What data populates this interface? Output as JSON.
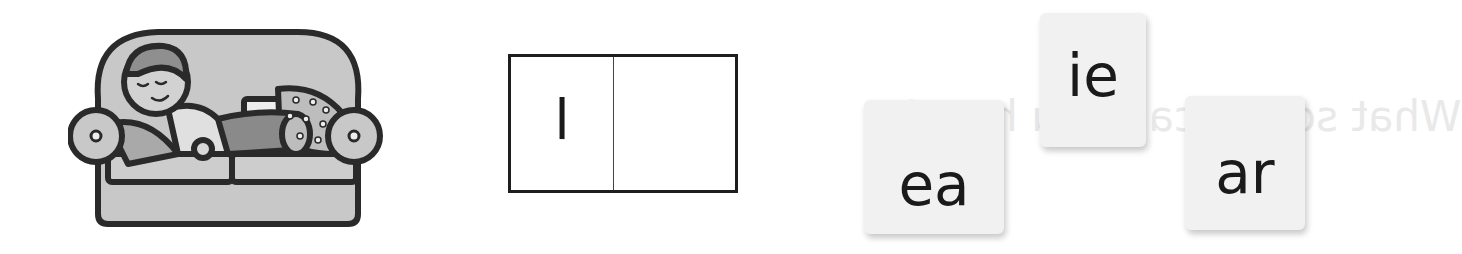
{
  "picture": {
    "description": "child sleeping on a sofa",
    "icon": "sleeping-child-on-sofa-icon",
    "colors": {
      "fill": "#c8c8c8",
      "outline": "#2a2a2a",
      "dark_fill": "#8a8a8a"
    }
  },
  "word_box": {
    "cells": [
      {
        "letter": "l"
      },
      {
        "letter": ""
      }
    ]
  },
  "ghost_text": {
    "line1": "What sound can you hear?"
  },
  "tiles": [
    {
      "label": "ea"
    },
    {
      "label": "ie"
    },
    {
      "label": "ar"
    }
  ],
  "colors": {
    "background": "#ffffff",
    "tile_bg": "#f1f1f1",
    "text": "#1a1a1a",
    "box_border": "#1e1e1e"
  }
}
